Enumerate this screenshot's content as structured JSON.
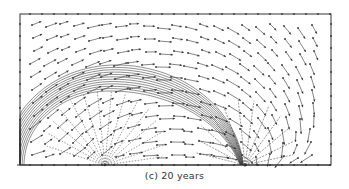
{
  "figure": {
    "caption": "(c) 20 years",
    "type": "vector-field-with-contours",
    "colors": {
      "line": "#333333",
      "background": "#ffffff"
    },
    "elements": {
      "frame": "rectangular domain boundary",
      "contours": "concentric arch-shaped contour bands rising from left boundary to a crest and falling to the lower boundary",
      "arrows": "velocity vectors with dot at tail",
      "source": "radial fan of dashed lines from lower boundary point inside the arch",
      "sink": "converging fan of lines to lower boundary point at right end of arch"
    },
    "contour_count": 12
  }
}
